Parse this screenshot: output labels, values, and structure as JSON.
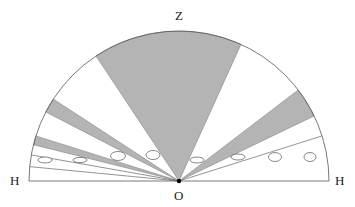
{
  "diagram": {
    "labels": {
      "zenith": "Z",
      "origin": "O",
      "horizon_left": "H",
      "horizon_right": "H"
    },
    "colors": {
      "shade": "#b4b4b4",
      "stroke": "#555555",
      "background": "#ffffff"
    },
    "geometry": {
      "center": [
        179,
        181
      ],
      "radius": 150
    },
    "shaded_sectors_deg": [
      {
        "from": 65.6,
        "to": 123.6
      },
      {
        "from": 25.7,
        "to": 37.4
      },
      {
        "from": 146.9,
        "to": 152.6
      },
      {
        "from": 162.5,
        "to": 166.0
      }
    ],
    "extra_rays_deg": [
      17.5,
      170.0,
      174.5
    ],
    "ellipses": [
      {
        "cx": 45,
        "cy": 160,
        "rx": 7,
        "ry": 3
      },
      {
        "cx": 80,
        "cy": 160,
        "rx": 7,
        "ry": 2.6
      },
      {
        "cx": 118,
        "cy": 156,
        "rx": 7.5,
        "ry": 4.5
      },
      {
        "cx": 153,
        "cy": 155,
        "rx": 7,
        "ry": 4.5
      },
      {
        "cx": 197,
        "cy": 160,
        "rx": 7,
        "ry": 3
      },
      {
        "cx": 238,
        "cy": 157,
        "rx": 7,
        "ry": 3
      },
      {
        "cx": 275,
        "cy": 157,
        "rx": 6.5,
        "ry": 4.5
      },
      {
        "cx": 310,
        "cy": 157,
        "rx": 6,
        "ry": 4.5
      }
    ]
  }
}
